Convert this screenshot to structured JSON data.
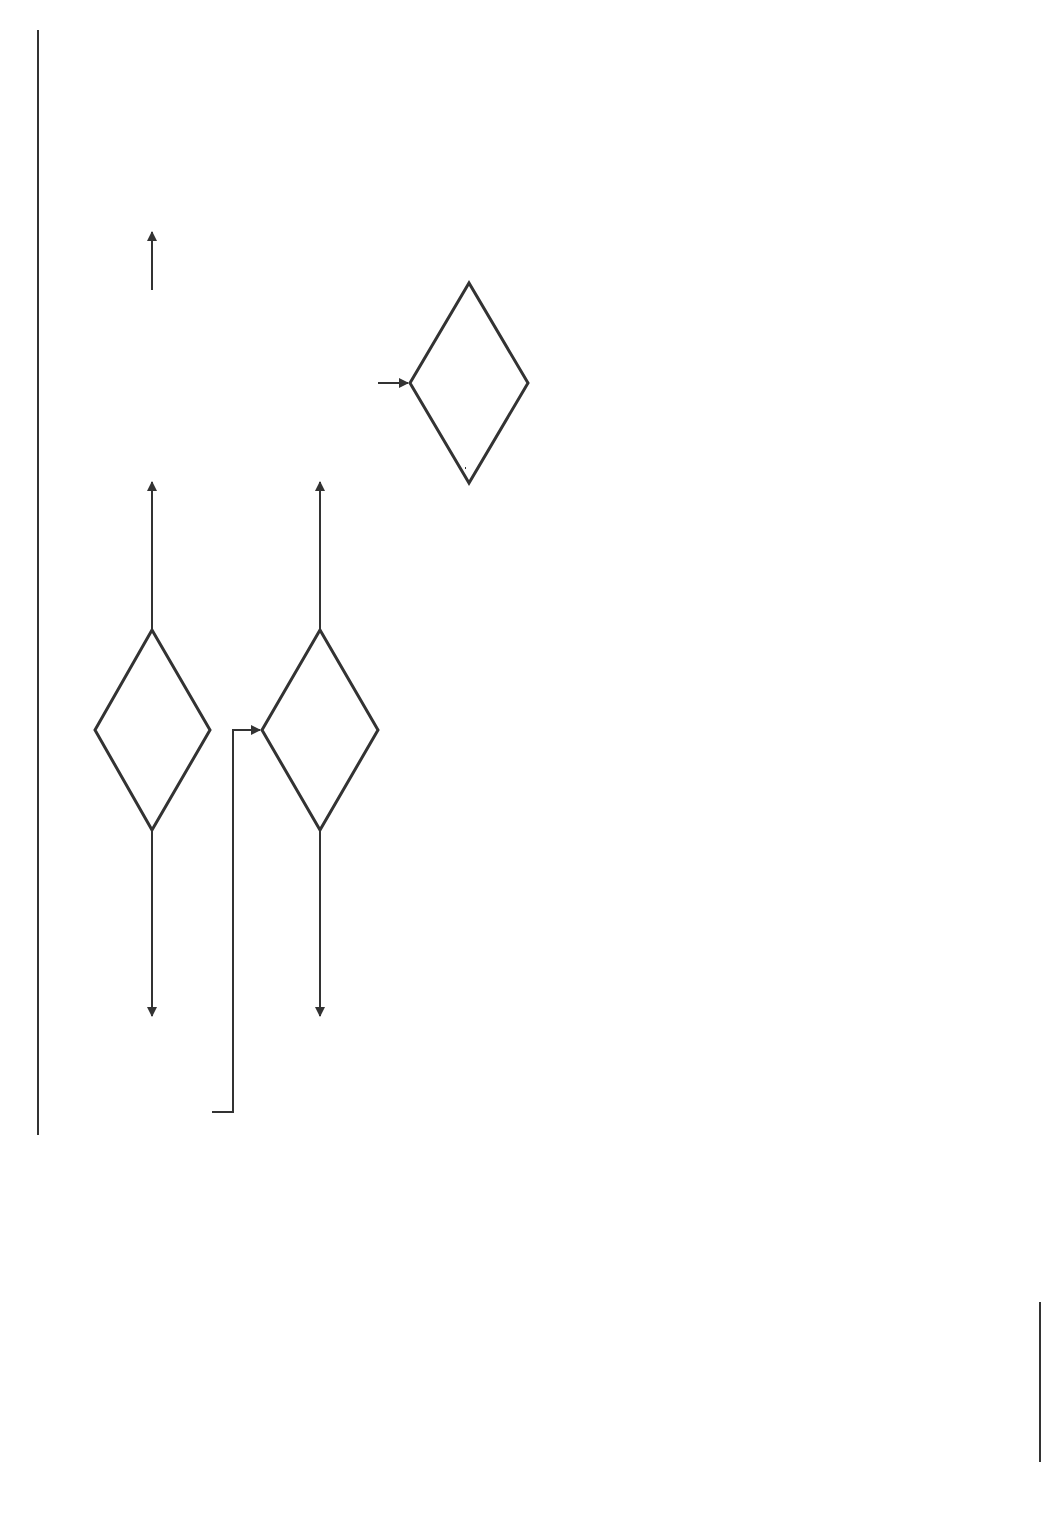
{
  "header": {
    "figure_label": "FIGURE 14.1"
  },
  "colors": {
    "line": "#333333",
    "figure_tag_bg": "#3a3a3a",
    "figure_tag_text": "#ffffff"
  },
  "nodes": {
    "number_of_variables": {
      "line1": "Number",
      "line2": "of Variables"
    },
    "univariate": {
      "line1": "Univariate",
      "line2": "Analysis"
    },
    "multivariate": {
      "line1": "Multivariate",
      "line2": "Analysis"
    },
    "figure_ref": "Figure 14.2",
    "level_of_measurement": {
      "line1": "Level of",
      "line2": "Measurement"
    },
    "nonparametric": {
      "line1": "Nonparametric",
      "line2": "Statistics"
    },
    "parametric": {
      "line1": "Parametric",
      "line2": "Statistics"
    },
    "param_num_samples": {
      "line1": "Number of",
      "line2": "Samples?"
    },
    "param_relationship": {
      "line1": "Relationship",
      "line2": "of Samples"
    },
    "param_one_result": {
      "line1_var": "z",
      "line1_rest": " test",
      "line2_var": "t",
      "line2_rest": " test"
    },
    "param_indep_result": {
      "line1_var": "z",
      "line1_rest": " test",
      "line2_var": "t",
      "line2_rest": " test",
      "line3": "Analysis of",
      "line4": "Variance"
    },
    "param_dep_result": {
      "var": "t",
      "sub": "r",
      "rest": " test"
    },
    "nonparam_num_samples": {
      "line1": "Number of",
      "line2": "Samples?"
    },
    "nonparam_relationship": {
      "line1": "Relationship",
      "line2": "of Samples?"
    },
    "lom_one": {
      "line1": "Level of",
      "line2": "Measurement?"
    },
    "lom_independent": {
      "line1": "Level of",
      "line2": "Measurement?"
    },
    "lom_dependent": {
      "line1": "Level of",
      "line2": "Measurement?"
    },
    "one_nominal_result": "Chi-square",
    "one_ordinal_result": {
      "line1": "Kolmogorov-",
      "line2": "Smirnov"
    },
    "indep_nominal_result": "Chi-square",
    "indep_ordinal_result": {
      "line1": "Mann-Whitney",
      "line2": "Median Test",
      "line3": "Kruskal-Wallis*"
    },
    "dep_nominal_result": {
      "line1": "McNemar",
      "line2_pre": "Cochran ",
      "line2_var": "Q",
      "line2_post": "*"
    },
    "dep_ordinal_result": {
      "line1": "Wilcoxon",
      "line2": "Friedman 2-Way",
      "line3": "Analysis of",
      "line4": "Variance*"
    }
  },
  "edge_labels": {
    "vars_one": "One",
    "vars_two_or_more": "Two or More",
    "nominal": "Nominal (N)",
    "ordinal": "Ordinal (O)",
    "interval": "Interval (I)",
    "ratio": "Ratio (R)",
    "param_one": "One",
    "param_two_or_more": "Two or More",
    "param_independent": "Independent",
    "param_dependent": "Dependent",
    "nonparam_one": "One",
    "nonparam_two_or_more": "Two or More",
    "nonparam_independent": "Independent",
    "nonparam_dependent": "Dependent",
    "one_n": "N",
    "one_o": "O",
    "indep_n": "N",
    "indep_o": "O",
    "dep_n": "N",
    "dep_o": "O"
  }
}
